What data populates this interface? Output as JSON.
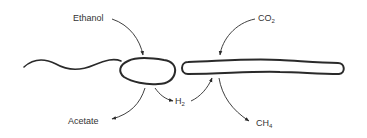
{
  "diagram": {
    "nodes": {
      "ethanol": {
        "text": "Ethanol"
      },
      "co2": {
        "base": "CO",
        "sub": "2"
      },
      "h2": {
        "base": "H",
        "sub": "2"
      },
      "acetate": {
        "text": "Acetate"
      },
      "ch4": {
        "base": "CH",
        "sub": "4"
      }
    },
    "organisms": [
      {
        "id": "flagellated-bacterium",
        "shape": "kidney-shaped cell with long wavy flagellum"
      },
      {
        "id": "methanogen",
        "shape": "long rod-shaped cell"
      }
    ],
    "edges": [
      {
        "from": "Ethanol",
        "to": "flagellated-bacterium"
      },
      {
        "from": "flagellated-bacterium",
        "to": "Acetate"
      },
      {
        "from": "flagellated-bacterium",
        "to": "H2"
      },
      {
        "from": "H2",
        "to": "methanogen"
      },
      {
        "from": "CO2",
        "to": "methanogen"
      },
      {
        "from": "methanogen",
        "to": "CH4"
      }
    ],
    "colors": {
      "stroke": "#2a2a2a",
      "text": "#333333",
      "background": "#ffffff"
    }
  }
}
